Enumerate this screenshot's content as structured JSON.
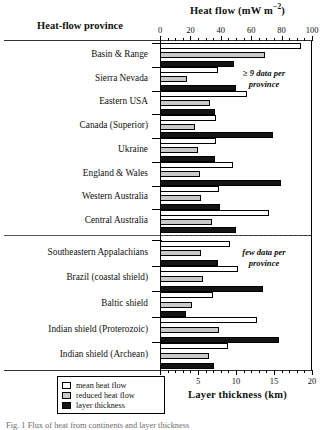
{
  "figure": {
    "province_header": "Heat-flow province",
    "caption": "Fig. 1 Flux of heat from continents and layer thickness"
  },
  "annotations": {
    "many": "≥ 9 data per\nprovince",
    "many_line1": "≥ 9 data per",
    "many_line2": "province",
    "few_line1": "few data per",
    "few_line2": "province"
  },
  "legend": {
    "items": [
      {
        "label": "mean heat flow",
        "swatch": "mean",
        "color": "#ffffff"
      },
      {
        "label": "reduced heat flow",
        "swatch": "reduced",
        "color": "#c9c9c9"
      },
      {
        "label": "layer thickness",
        "swatch": "thick",
        "color": "#141414"
      }
    ]
  },
  "chart_data": {
    "type": "bar",
    "orientation": "horizontal",
    "title": "",
    "grid": false,
    "legend_position": "bottom-left",
    "axes": {
      "top": {
        "label_prefix": "Heat flow (mW m",
        "label_sup": "−2",
        "label_suffix": ")",
        "label_plain": "Heat flow (mW m−2)",
        "ticks": [
          0,
          20,
          40,
          60,
          80,
          100
        ],
        "minor_step": 5,
        "range": [
          0,
          100
        ],
        "unit": "mW m−2"
      },
      "bottom": {
        "label": "Layer thickness (km)",
        "ticks": [
          0,
          5,
          10,
          15,
          20
        ],
        "minor_step": 1,
        "range": [
          0,
          20
        ],
        "unit": "km"
      }
    },
    "series": [
      {
        "name": "mean heat flow",
        "axis": "top",
        "color": "#ffffff"
      },
      {
        "name": "reduced heat flow",
        "axis": "top",
        "color": "#c9c9c9"
      },
      {
        "name": "layer thickness",
        "axis": "bottom",
        "color": "#141414"
      }
    ],
    "groups": [
      {
        "section": "many",
        "categories": [
          "Basin & Range",
          "Sierra Nevada",
          "Eastern USA",
          "Canada (Superior)",
          "Ukraine",
          "England & Wales",
          "Western Australia",
          "Central Australia"
        ],
        "mean_heat_flow": [
          93,
          38,
          57,
          37,
          37,
          48,
          39,
          72
        ],
        "reduced_heat_flow": [
          69,
          18,
          33,
          23,
          25,
          26,
          27,
          34
        ],
        "layer_thickness": [
          9.8,
          10.0,
          7.3,
          14.9,
          7.3,
          15.9,
          7.9,
          10.0
        ]
      },
      {
        "section": "few",
        "categories": [
          "Southeastern Appalachians",
          "Brazil (coastal shield)",
          "Baltic shield",
          "Indian shield (Proterozoic)",
          "Indian shield (Archean)"
        ],
        "mean_heat_flow": [
          46,
          51,
          35,
          64,
          45
        ],
        "reduced_heat_flow": [
          27,
          28,
          21,
          39,
          32
        ],
        "layer_thickness": [
          7.6,
          13.6,
          3.4,
          15.6,
          7.1
        ]
      }
    ]
  }
}
